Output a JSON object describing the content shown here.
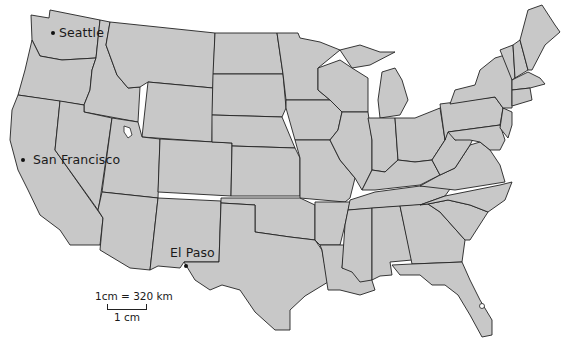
{
  "map": {
    "title": "",
    "subject": "Contiguous United States",
    "fill_color": "#c8c8c8",
    "border_color": "#222222",
    "background": "#ffffff"
  },
  "cities": [
    {
      "name": "Seattle",
      "x": 52,
      "y": 33,
      "label_x": 59,
      "label_y": 25
    },
    {
      "name": "San Francisco",
      "x": 22,
      "y": 160,
      "label_x": 33,
      "label_y": 152
    },
    {
      "name": "El Paso",
      "x": 186,
      "y": 266,
      "label_x": 170,
      "label_y": 245
    }
  ],
  "scale": {
    "ratio_label": "1cm = 320 km",
    "bar_label": "1 cm",
    "bar_length_px": 38
  }
}
